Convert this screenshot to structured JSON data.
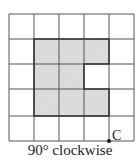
{
  "grid": {
    "rows": 5,
    "cols": 5
  },
  "shape": {
    "description": "Shaded C-shaped region in 3x3 block with notch on right middle",
    "fill": "#d9d9d9"
  },
  "point_label": "C",
  "caption": "90° clockwise"
}
